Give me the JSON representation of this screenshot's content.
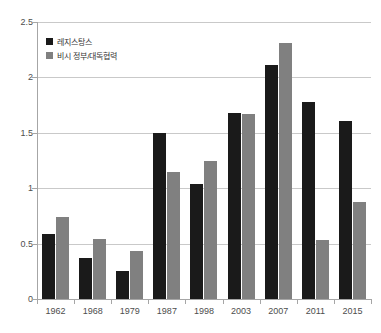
{
  "chart_data": {
    "type": "bar",
    "title": "",
    "subtitle": "",
    "xlabel": "",
    "ylabel": "",
    "ylim": [
      0,
      2.5
    ],
    "yticks": [
      "0",
      "0.5",
      "1",
      "1.5",
      "2",
      "2.5"
    ],
    "ytick_values": [
      0,
      0.5,
      1,
      1.5,
      2,
      2.5
    ],
    "grid": true,
    "legend_position": "top-left",
    "categories": [
      "1962",
      "1968",
      "1979",
      "1987",
      "1998",
      "2003",
      "2007",
      "2011",
      "2015"
    ],
    "series": [
      {
        "name": "레지스탕스",
        "color": "#1a1a1a",
        "values": [
          0.59,
          0.37,
          0.25,
          1.5,
          1.04,
          1.68,
          2.11,
          1.78,
          1.61
        ]
      },
      {
        "name": "비시 정부/대독협력",
        "color": "#808080",
        "values": [
          0.74,
          0.54,
          0.43,
          1.15,
          1.25,
          1.67,
          2.31,
          0.53,
          0.88
        ]
      }
    ]
  },
  "colors": {
    "series_a": "#1a1a1a",
    "series_b": "#808080",
    "gridline": "#c9c9c9",
    "axis": "#a6a6a6",
    "tick_text": "#4d4d4d",
    "background": "#ffffff"
  }
}
